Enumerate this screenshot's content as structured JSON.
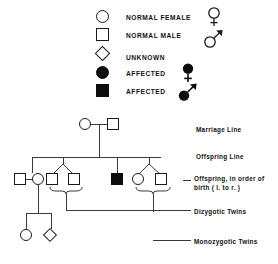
{
  "legend": {
    "items": [
      {
        "shape": "circle",
        "filled": false,
        "label": "NORMAL FEMALE",
        "gender": "venus-outline"
      },
      {
        "shape": "square",
        "filled": false,
        "label": "NORMAL MALE",
        "gender": "mars-outline"
      },
      {
        "shape": "diamond",
        "filled": false,
        "label": "UNKNOWN",
        "gender": ""
      },
      {
        "shape": "circle",
        "filled": true,
        "label": "AFFECTED",
        "gender": "venus-filled"
      },
      {
        "shape": "square",
        "filled": true,
        "label": "AFFECTED",
        "gender": "mars-filled"
      }
    ]
  },
  "annotations": [
    {
      "id": "marriage-line",
      "text": "Marriage Line"
    },
    {
      "id": "offspring-line",
      "text": "Offspring Line"
    },
    {
      "id": "birth-order",
      "text": "Offspring, in order of birth ( l. to r. )"
    },
    {
      "id": "dizygotic",
      "text": "Dizygotic Twins"
    },
    {
      "id": "monozygotic",
      "text": "Monozygotic Twins"
    }
  ],
  "pedigree": {
    "generation_1": [
      {
        "id": "i-1",
        "shape": "circle",
        "filled": false,
        "sex": "female"
      },
      {
        "id": "i-2",
        "shape": "square",
        "filled": false,
        "sex": "male"
      }
    ],
    "generation_2": [
      {
        "id": "ii-spouse",
        "shape": "square",
        "filled": false,
        "sex": "male",
        "role": "spouse"
      },
      {
        "id": "ii-1",
        "shape": "circle",
        "filled": false,
        "sex": "female",
        "role": "offspring"
      },
      {
        "id": "ii-2",
        "shape": "square",
        "filled": false,
        "sex": "male",
        "role": "dizygotic-twin"
      },
      {
        "id": "ii-3",
        "shape": "square",
        "filled": false,
        "sex": "male",
        "role": "dizygotic-twin"
      },
      {
        "id": "ii-4",
        "shape": "square",
        "filled": true,
        "sex": "male",
        "role": "offspring-affected"
      },
      {
        "id": "ii-5",
        "shape": "circle",
        "filled": false,
        "sex": "female",
        "role": "monozygotic-twin"
      },
      {
        "id": "ii-6",
        "shape": "square",
        "filled": false,
        "sex": "male",
        "role": "monozygotic-twin"
      }
    ],
    "generation_3": [
      {
        "id": "iii-1",
        "shape": "circle",
        "filled": false,
        "sex": "female"
      },
      {
        "id": "iii-2",
        "shape": "diamond",
        "filled": false,
        "sex": "unknown"
      }
    ]
  },
  "colors": {
    "ink": "#111111",
    "line": "#3a3a3a",
    "fill": "#0d0d0d",
    "background": "#ffffff"
  }
}
